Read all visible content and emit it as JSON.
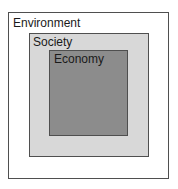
{
  "diagram": {
    "type": "nested-boxes",
    "layers": [
      {
        "label": "Environment",
        "fill": "#ffffff"
      },
      {
        "label": "Society",
        "fill": "#d8d8d8"
      },
      {
        "label": "Economy",
        "fill": "#8c8c8c"
      }
    ],
    "border_color": "#4f4f4f"
  }
}
